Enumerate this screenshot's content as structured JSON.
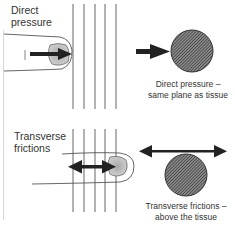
{
  "panels": [
    {
      "title_line1": "Direct",
      "title_line2": "pressure",
      "caption_line1": "Direct pressure –",
      "caption_line2": "same plane as tissue",
      "arrow": "single-right-arrow"
    },
    {
      "title_line1": "Transverse",
      "title_line2": "frictions",
      "caption_line1": "Transverse frictions –",
      "caption_line2": "above the tissue",
      "arrow": "double-horizontal-arrow"
    }
  ],
  "colors": {
    "tissue_fill": "#555555",
    "arrow": "#222222",
    "lines": "#555555",
    "fingertip_shade": "#bbbbbb"
  }
}
